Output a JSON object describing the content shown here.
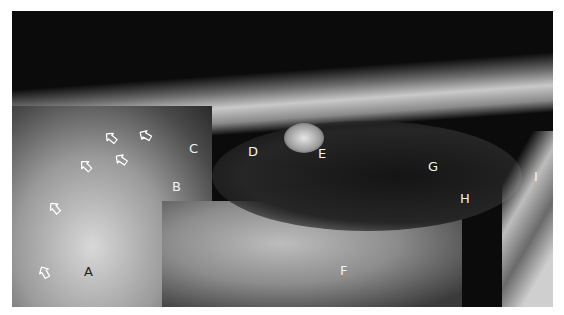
{
  "figure": {
    "labels": [
      {
        "id": "A",
        "text": "A",
        "x": 84,
        "y": 265,
        "color": "#222222"
      },
      {
        "id": "B",
        "text": "B",
        "x": 172,
        "y": 180,
        "color": "#f2f2f2"
      },
      {
        "id": "C",
        "text": "C",
        "x": 189,
        "y": 142,
        "color": "#f2f2f2"
      },
      {
        "id": "D",
        "text": "D",
        "x": 248,
        "y": 145,
        "color": "#f2f2f2"
      },
      {
        "id": "E",
        "text": "E",
        "x": 318,
        "y": 147,
        "color": "#f2f2f2"
      },
      {
        "id": "F",
        "text": "F",
        "x": 340,
        "y": 264,
        "color": "#f2f2f2"
      },
      {
        "id": "G",
        "text": "G",
        "x": 428,
        "y": 160,
        "color": "#f2f2f2"
      },
      {
        "id": "H",
        "text": "H",
        "x": 460,
        "y": 192,
        "color": "#f2f2f2"
      },
      {
        "id": "I",
        "text": "I",
        "x": 534,
        "y": 170,
        "color": "#f2f2f2"
      }
    ],
    "arrows": [
      {
        "x": 38,
        "y": 264,
        "rot": -30
      },
      {
        "x": 48,
        "y": 200,
        "rot": -40
      },
      {
        "x": 79,
        "y": 158,
        "rot": -45
      },
      {
        "x": 104,
        "y": 130,
        "rot": -50
      },
      {
        "x": 114,
        "y": 152,
        "rot": -55
      },
      {
        "x": 138,
        "y": 128,
        "rot": -60
      }
    ]
  }
}
